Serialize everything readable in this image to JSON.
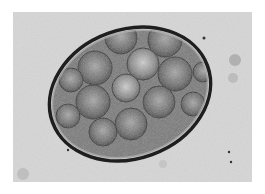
{
  "image": {
    "description": "Grayscale light micrograph of an oval egg/cyst containing clustered spherical cells",
    "background_color": "#d9d9d9",
    "shell_color": "#1e1e1e",
    "cell_count_visible": 14
  }
}
